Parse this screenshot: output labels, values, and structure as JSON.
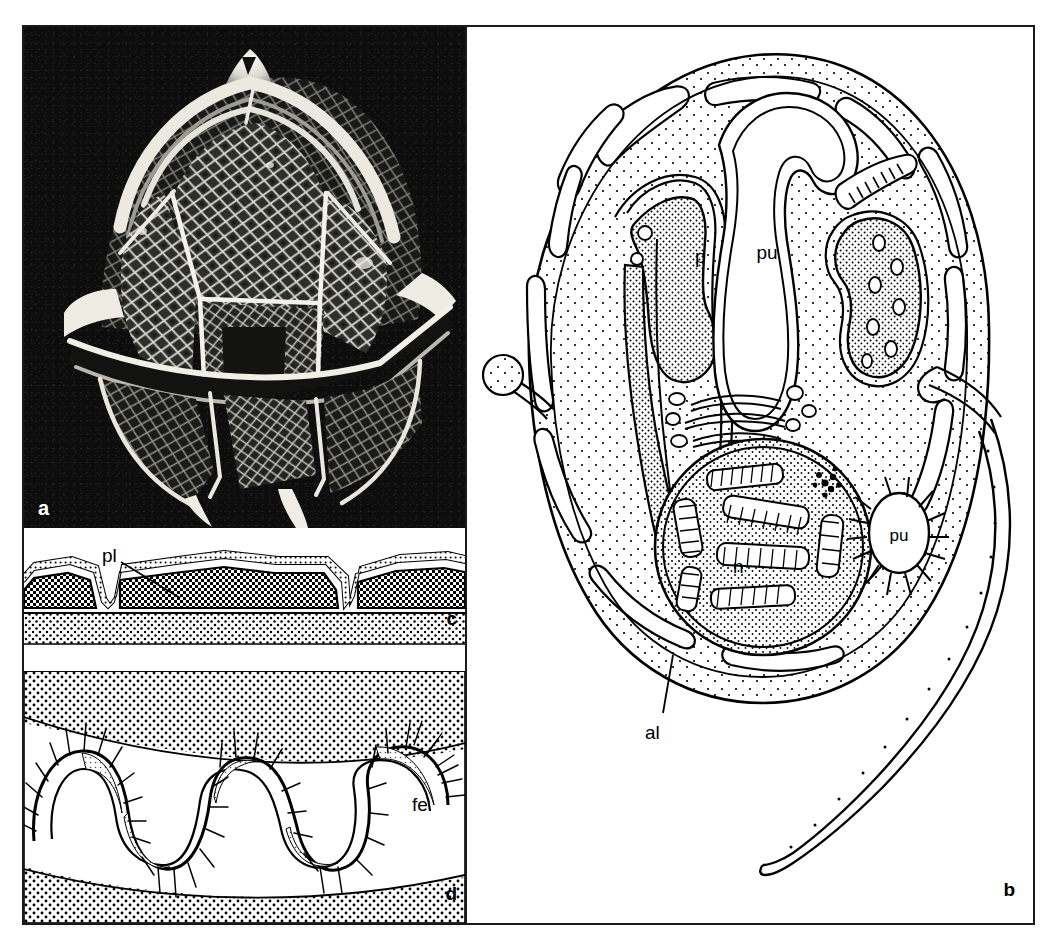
{
  "figure": {
    "panels": [
      {
        "letter": "a",
        "type": "sem-micrograph",
        "description": "Scanning electron micrograph of an armoured dinoflagellate theca with reticulate plate ornamentation, apical horn and antapical spines"
      },
      {
        "letter": "b",
        "type": "line-drawing",
        "description": "Schematic longitudinal section of a dinoflagellate cell showing organelles and the trailing longitudinal flagellum",
        "labels": [
          {
            "text": "pu",
            "meaning": "pusule"
          },
          {
            "text": "p",
            "meaning": "plastid"
          },
          {
            "text": "n",
            "meaning": "nucleus with permanently condensed chromosomes"
          },
          {
            "text": "pu",
            "meaning": "pusule (collecting chamber)"
          },
          {
            "text": "al",
            "meaning": "amphiesmal alveolus"
          }
        ]
      },
      {
        "letter": "c",
        "type": "line-drawing",
        "description": "Cross section through the amphiesma showing thecal plates within alveolar vesicles",
        "labels": [
          {
            "text": "pl",
            "meaning": "thecal plate"
          }
        ]
      },
      {
        "letter": "d",
        "type": "line-drawing",
        "description": "Detail of the transverse flagellum within the cingulum, showing the striated strand and flagellar hairs",
        "labels": [
          {
            "text": "fe",
            "meaning": "flagellar hairs / ribbon"
          }
        ]
      }
    ],
    "label_a": "a",
    "label_b": "b",
    "label_c": "c",
    "label_d": "d",
    "label_pu_upper": "pu",
    "label_pu_lower": "pu",
    "label_p": "p",
    "label_n": "n",
    "label_al": "al",
    "label_pl": "pl",
    "label_fe": "fe",
    "colors": {
      "ink": "#000000",
      "frame": "#1a1a1a",
      "paper": "#ffffff",
      "micrograph_background": "#0d0d0d",
      "micrograph_highlight": "#f2f2ee"
    }
  }
}
